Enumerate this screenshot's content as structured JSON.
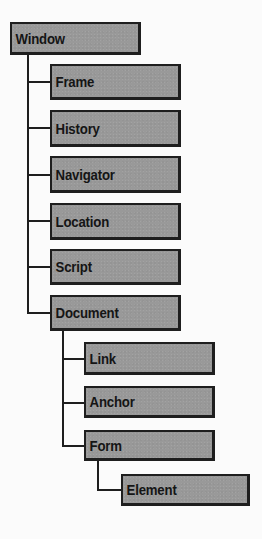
{
  "diagram": {
    "type": "tree",
    "title": "",
    "root": {
      "label": "Window",
      "children": [
        {
          "label": "Frame"
        },
        {
          "label": "History"
        },
        {
          "label": "Navigator"
        },
        {
          "label": "Location"
        },
        {
          "label": "Script"
        },
        {
          "label": "Document",
          "children": [
            {
              "label": "Link"
            },
            {
              "label": "Anchor"
            },
            {
              "label": "Form",
              "children": [
                {
                  "label": "Element"
                }
              ]
            }
          ]
        }
      ]
    },
    "nodes": {
      "window": "Window",
      "frame": "Frame",
      "history": "History",
      "navigator": "Navigator",
      "location": "Location",
      "script": "Script",
      "document": "Document",
      "link": "Link",
      "anchor": "Anchor",
      "form": "Form",
      "element": "Element"
    },
    "colors": {
      "node_fill": "#999999",
      "node_border": "#1e1e1e",
      "connector": "#1e1e1e",
      "text": "#151515",
      "background": "#fbfbfb"
    }
  }
}
